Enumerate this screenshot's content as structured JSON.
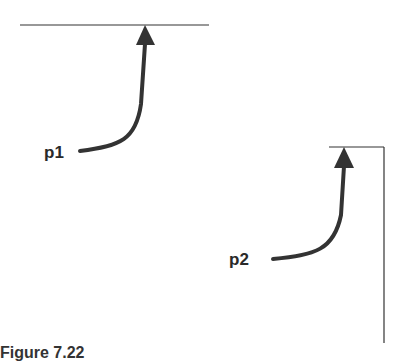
{
  "diagram": {
    "points": [
      {
        "label": "p1",
        "description": "arrow pointing up to horizontal line"
      },
      {
        "label": "p2",
        "description": "arrow pointing up to corner of horizontal and vertical line"
      }
    ],
    "caption": "Figure 7.22"
  }
}
